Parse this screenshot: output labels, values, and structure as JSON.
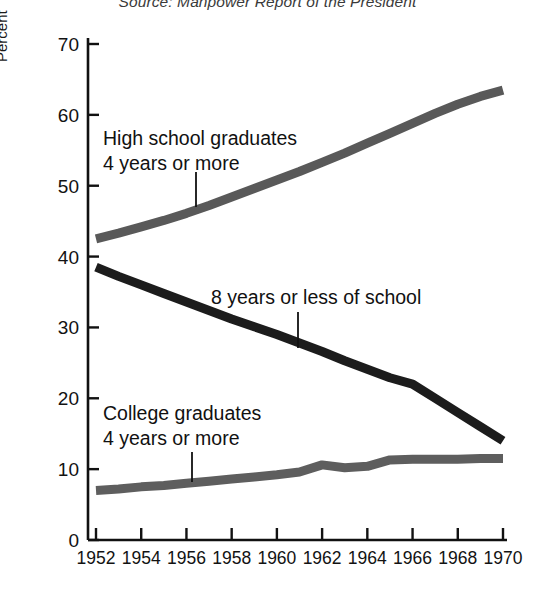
{
  "source_note": "Source: Manpower Report of the President",
  "axis": {
    "ylabel": "Percent",
    "yticks": [
      "0",
      "10",
      "20",
      "30",
      "40",
      "50",
      "60",
      "70"
    ],
    "xticks": [
      "1952",
      "1954",
      "1956",
      "1958",
      "1960",
      "1962",
      "1964",
      "1966",
      "1968",
      "1970"
    ]
  },
  "labels": {
    "highschool_line1": "High school graduates",
    "highschool_line2": "4 years or more",
    "eightyears_line1": "8 years or less of school",
    "college_line1": "College graduates",
    "college_line2": "4 years or more"
  },
  "colors": {
    "highschool": "#595959",
    "eightyears": "#1c1c1c",
    "college": "#5e5e5e",
    "axis": "#111111",
    "background": "#ffffff"
  },
  "chart_data": {
    "type": "line",
    "title": "",
    "subtitle": "",
    "xlabel": "",
    "ylabel": "Percent",
    "xlim": [
      1952,
      1970
    ],
    "ylim": [
      0,
      70
    ],
    "grid": false,
    "legend": "annotated-inline",
    "x": [
      1952,
      1953,
      1954,
      1955,
      1956,
      1957,
      1958,
      1959,
      1960,
      1961,
      1962,
      1963,
      1964,
      1965,
      1966,
      1967,
      1968,
      1969,
      1970
    ],
    "series": [
      {
        "name": "High school graduates, 4 years or more",
        "color": "#595959",
        "values": [
          42.5,
          43.3,
          44.2,
          45.1,
          46.1,
          47.2,
          48.4,
          49.6,
          50.8,
          52.0,
          53.3,
          54.6,
          56.0,
          57.4,
          58.8,
          60.2,
          61.5,
          62.6,
          63.5
        ]
      },
      {
        "name": "8 years or less of school",
        "color": "#1c1c1c",
        "values": [
          38.5,
          37.2,
          36.0,
          34.8,
          33.6,
          32.4,
          31.2,
          30.1,
          29.0,
          27.8,
          26.6,
          25.3,
          24.1,
          22.9,
          22.0,
          20.0,
          18.0,
          16.0,
          14.0
        ]
      },
      {
        "name": "College graduates, 4 years or more",
        "color": "#5e5e5e",
        "values": [
          7.0,
          7.2,
          7.5,
          7.7,
          8.0,
          8.3,
          8.6,
          8.9,
          9.2,
          9.6,
          10.6,
          10.2,
          10.4,
          11.3,
          11.4,
          11.4,
          11.4,
          11.5,
          11.5
        ]
      }
    ],
    "annotations": [
      {
        "text": "High school graduates 4 years or more",
        "target_x": 1956.2,
        "target_y": 47.5
      },
      {
        "text": "8 years or less of school",
        "target_x": 1961.5,
        "target_y": 28.0
      },
      {
        "text": "College graduates 4 years or more",
        "target_x": 1955.8,
        "target_y": 8.0
      }
    ]
  }
}
